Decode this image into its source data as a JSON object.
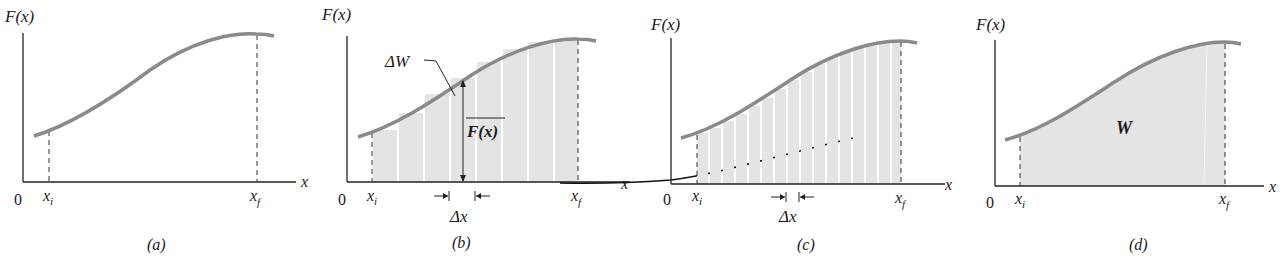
{
  "colors": {
    "curve": "#8a8a8a",
    "fill": "#e4e4e4",
    "axis": "#222222",
    "strip_gap": "#ffffff"
  },
  "panels": [
    {
      "id": "a",
      "caption": "(a)",
      "y_label": "F(x)",
      "x_label": "x",
      "origin_label": "0",
      "xi_label": "x",
      "xi_sub": "i",
      "xf_label": "x",
      "xf_sub": "f"
    },
    {
      "id": "b",
      "caption": "(b)",
      "y_label": "F(x)",
      "x_label": "x",
      "origin_label": "0",
      "xi_label": "x",
      "xi_sub": "i",
      "xf_label": "x",
      "xf_sub": "f",
      "delta_w_label": "ΔW",
      "avg_force_label": "F(x)",
      "delta_x_label": "Δx"
    },
    {
      "id": "c",
      "caption": "(c)",
      "y_label": "F(x)",
      "x_label": "x",
      "origin_label": "0",
      "xi_label": "x",
      "xi_sub": "i",
      "xf_label": "x",
      "xf_sub": "f",
      "delta_x_label": "Δx"
    },
    {
      "id": "d",
      "caption": "(d)",
      "y_label": "F(x)",
      "x_label": "x",
      "origin_label": "0",
      "xi_label": "x",
      "xi_sub": "i",
      "xf_label": "x",
      "xf_sub": "f",
      "area_label": "W"
    }
  ]
}
